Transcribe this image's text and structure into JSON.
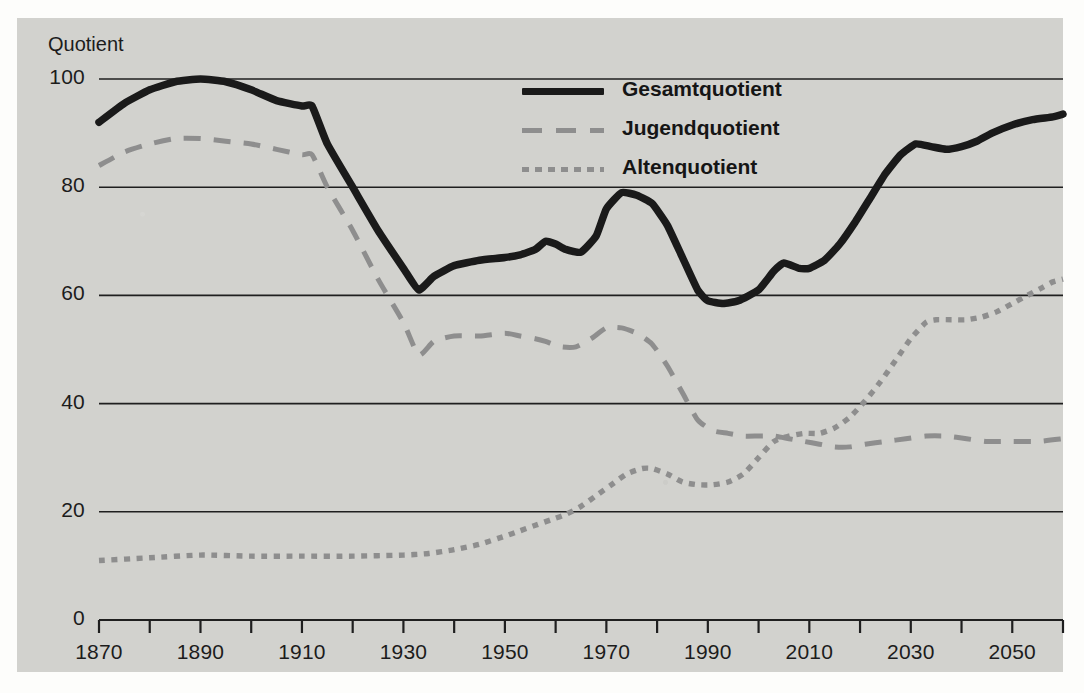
{
  "chart_data": {
    "type": "line",
    "title": "",
    "xlabel": "",
    "ylabel": "Quotient",
    "xlim": [
      1870,
      2060
    ],
    "ylim": [
      0,
      100
    ],
    "grid": true,
    "legend_position": "top-center",
    "y_ticks": [
      "0",
      "20",
      "40",
      "60",
      "80",
      "100"
    ],
    "y_tick_values": [
      0,
      20,
      40,
      60,
      80,
      100
    ],
    "x_ticks": [
      "1870",
      "1890",
      "1910",
      "1930",
      "1950",
      "1970",
      "1990",
      "2010",
      "2030",
      "2050"
    ],
    "x_tick_values": [
      1870,
      1890,
      1910,
      1930,
      1950,
      1970,
      1990,
      2010,
      2030,
      2050
    ],
    "x_minor_step": 10,
    "series": [
      {
        "name": "Gesamtquotient",
        "style": "solid",
        "color": "#1a1a1a",
        "x": [
          1870,
          1875,
          1880,
          1885,
          1890,
          1895,
          1900,
          1905,
          1910,
          1912,
          1915,
          1920,
          1925,
          1930,
          1933,
          1936,
          1940,
          1945,
          1950,
          1953,
          1956,
          1958,
          1960,
          1962,
          1965,
          1968,
          1970,
          1973,
          1976,
          1979,
          1982,
          1985,
          1988,
          1990,
          1993,
          1996,
          2000,
          2003,
          2005,
          2008,
          2010,
          2013,
          2016,
          2019,
          2022,
          2025,
          2028,
          2031,
          2034,
          2037,
          2040,
          2043,
          2046,
          2050,
          2054,
          2058,
          2060
        ],
        "values": [
          92,
          95.5,
          98,
          99.5,
          100,
          99.5,
          98,
          96,
          95,
          95,
          88,
          80,
          72,
          65,
          61,
          63.5,
          65.5,
          66.5,
          67,
          67.5,
          68.5,
          70,
          69.5,
          68.5,
          68,
          71,
          76,
          79,
          78.5,
          77,
          73,
          67,
          61,
          59,
          58.5,
          59,
          61,
          64.5,
          66,
          65,
          65,
          66.5,
          69.5,
          73.5,
          78,
          82.5,
          86,
          88,
          87.5,
          87,
          87.5,
          88.5,
          90,
          91.5,
          92.5,
          93,
          93.5
        ]
      },
      {
        "name": "Jugendquotient",
        "style": "dashed",
        "color": "#8e8e8e",
        "x": [
          1870,
          1875,
          1880,
          1885,
          1890,
          1895,
          1900,
          1905,
          1910,
          1912,
          1915,
          1920,
          1925,
          1930,
          1933,
          1936,
          1940,
          1945,
          1950,
          1953,
          1956,
          1958,
          1961,
          1964,
          1967,
          1970,
          1973,
          1976,
          1979,
          1982,
          1985,
          1988,
          1991,
          1994,
          1997,
          2000,
          2003,
          2006,
          2009,
          2012,
          2015,
          2018,
          2021,
          2025,
          2029,
          2033,
          2037,
          2041,
          2045,
          2050,
          2055,
          2060
        ],
        "values": [
          84,
          86.5,
          88,
          89,
          89,
          88.5,
          88,
          87,
          86,
          86,
          80,
          72,
          63,
          55,
          49,
          51.5,
          52.5,
          52.5,
          53,
          52.5,
          52,
          51.5,
          50.5,
          50.5,
          52,
          54,
          54,
          53,
          51,
          47,
          42,
          37,
          35,
          34.5,
          34,
          34,
          34,
          33.5,
          33,
          32.5,
          32,
          32,
          32.5,
          33,
          33.5,
          34,
          34,
          33.5,
          33,
          33,
          33,
          33.5
        ]
      },
      {
        "name": "Altenquotient",
        "style": "dotted",
        "color": "#8e8e8e",
        "x": [
          1870,
          1880,
          1890,
          1900,
          1910,
          1920,
          1930,
          1935,
          1940,
          1945,
          1950,
          1953,
          1956,
          1959,
          1962,
          1965,
          1968,
          1971,
          1974,
          1977,
          1979,
          1982,
          1985,
          1988,
          1991,
          1994,
          1997,
          2000,
          2003,
          2006,
          2009,
          2012,
          2015,
          2018,
          2021,
          2024,
          2027,
          2030,
          2033,
          2035,
          2038,
          2041,
          2044,
          2047,
          2050,
          2053,
          2056,
          2058,
          2060
        ],
        "values": [
          11,
          11.5,
          12,
          11.8,
          11.8,
          11.8,
          12,
          12.3,
          13,
          14,
          15.5,
          16.5,
          17.5,
          18.5,
          19.5,
          21,
          23,
          25,
          27,
          28,
          28,
          27,
          25.5,
          25,
          25,
          25.5,
          27,
          30,
          33,
          34,
          34.5,
          34.5,
          35.5,
          37.5,
          40.5,
          44,
          48,
          52,
          55,
          55.5,
          55.5,
          55.5,
          56,
          57,
          58.5,
          60,
          61.5,
          62.5,
          63
        ]
      }
    ]
  },
  "legend": {
    "items": [
      {
        "label": "Gesamtquotient",
        "style": "solid"
      },
      {
        "label": "Jugendquotient",
        "style": "dashed"
      },
      {
        "label": "Altenquotient",
        "style": "dotted"
      }
    ]
  },
  "colors": {
    "panel_background": "#d2d2ce",
    "page_background": "#fdfdfb",
    "primary_line": "#1a1a1a",
    "secondary_line": "#8e8e8e",
    "gridline": "#1f1f1f",
    "text": "#1c1c1c"
  }
}
